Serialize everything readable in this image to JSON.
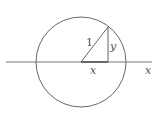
{
  "diagram": {
    "type": "unit-circle",
    "colors": {
      "stroke": "#666666",
      "text": "#555555",
      "background": "#ffffff"
    },
    "labels": {
      "hypotenuse": "1",
      "vertical_leg": "y",
      "horizontal_leg": "x",
      "axis": "x"
    }
  }
}
